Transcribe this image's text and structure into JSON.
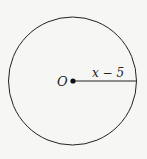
{
  "diagram": {
    "center_label": "O",
    "radius_label": "x − 5",
    "stroke_color": "#222222",
    "background": "#f6f6f4"
  }
}
